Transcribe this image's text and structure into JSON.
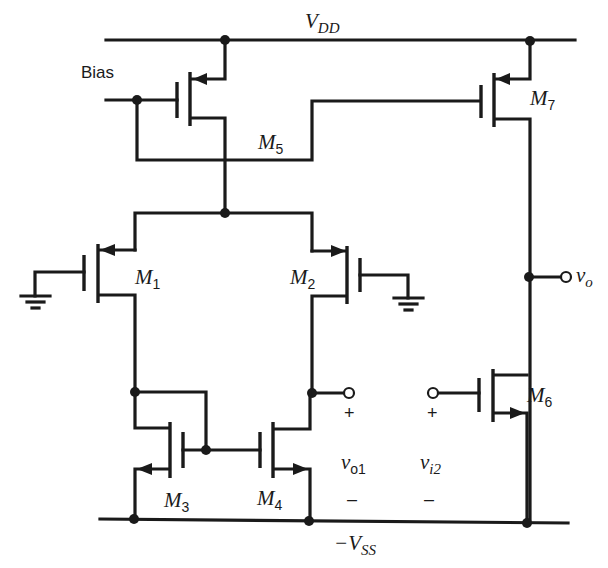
{
  "diagram": {
    "type": "CMOS two-stage operational amplifier schematic",
    "rails": {
      "top": {
        "label_main": "V",
        "label_sub": "DD"
      },
      "bottom": {
        "label_prefix": "−",
        "label_main": "V",
        "label_sub": "SS"
      }
    },
    "bias_label": "Bias",
    "transistors": [
      {
        "id": "M5",
        "main": "M",
        "sub": "5",
        "type": "PMOS"
      },
      {
        "id": "M7",
        "main": "M",
        "sub": "7",
        "type": "PMOS"
      },
      {
        "id": "M1",
        "main": "M",
        "sub": "1",
        "type": "PMOS"
      },
      {
        "id": "M2",
        "main": "M",
        "sub": "2",
        "type": "PMOS"
      },
      {
        "id": "M3",
        "main": "M",
        "sub": "3",
        "type": "NMOS"
      },
      {
        "id": "M4",
        "main": "M",
        "sub": "4",
        "type": "NMOS"
      },
      {
        "id": "M6",
        "main": "M",
        "sub": "6",
        "type": "NMOS"
      }
    ],
    "terminals": {
      "vo": {
        "main": "v",
        "sub": "o"
      },
      "vo1": {
        "main": "v",
        "sub": "o1",
        "plus": "+",
        "minus": "–"
      },
      "vi2": {
        "main": "v",
        "sub": "i2",
        "plus": "+",
        "minus": "–"
      }
    },
    "colors": {
      "ink": "#1a1a1a",
      "background": "#ffffff"
    }
  }
}
